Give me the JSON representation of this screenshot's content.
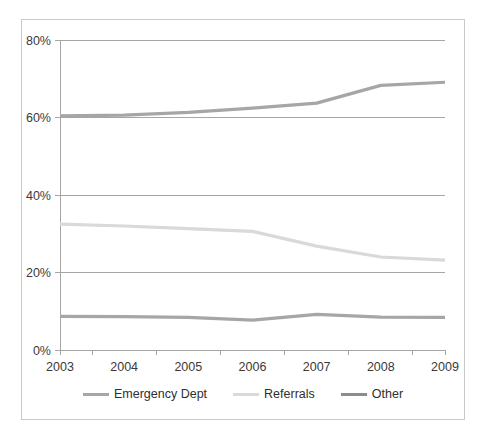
{
  "chart_data": {
    "type": "line",
    "title": "",
    "subtitle": "",
    "xlabel": "",
    "ylabel": "",
    "categories": [
      "2003",
      "2004",
      "2005",
      "2006",
      "2007",
      "2008",
      "2009"
    ],
    "x": [
      2003,
      2004,
      2005,
      2006,
      2007,
      2008,
      2009
    ],
    "ylim": [
      0,
      80
    ],
    "xlim": [
      2003,
      2009
    ],
    "yticks": [
      0,
      20,
      40,
      60,
      80
    ],
    "ytick_labels": [
      "0%",
      "20%",
      "40%",
      "60%",
      "80%"
    ],
    "xtick_labels": [
      "2003",
      "2004",
      "2005",
      "2006",
      "2007",
      "2008",
      "2009"
    ],
    "grid": true,
    "grid_axis": "y",
    "legend_position": "bottom",
    "value_suffix": "%",
    "series": [
      {
        "name": "Emergency Dept",
        "color": "#a6a6a6",
        "values": [
          60.4,
          60.6,
          61.3,
          62.4,
          63.7,
          68.3,
          69.1
        ]
      },
      {
        "name": "Referrals",
        "color": "#d9d9d9",
        "values": [
          32.5,
          32.0,
          31.3,
          30.6,
          26.8,
          24.0,
          23.2
        ]
      },
      {
        "name": "Other",
        "color": "#a6a6a6",
        "values": [
          8.7,
          8.6,
          8.4,
          7.7,
          9.2,
          8.5,
          8.4
        ]
      }
    ]
  },
  "legend": {
    "items": [
      {
        "label": "Emergency Dept",
        "color": "#a6a6a6"
      },
      {
        "label": "Referrals",
        "color": "#d9d9d9"
      },
      {
        "label": "Other",
        "color": "#8c8c8c"
      }
    ]
  },
  "axes": {
    "y_tick_labels": [
      "80%",
      "60%",
      "40%",
      "20%",
      "0%"
    ],
    "x_tick_labels": [
      "2003",
      "2004",
      "2005",
      "2006",
      "2007",
      "2008",
      "2009"
    ]
  },
  "colors": {
    "frame_border": "#c9c9c9",
    "gridline": "#a6a6a6",
    "axis_line": "#a6a6a6",
    "tick_text": "#3a3a3a",
    "background": "#ffffff"
  }
}
